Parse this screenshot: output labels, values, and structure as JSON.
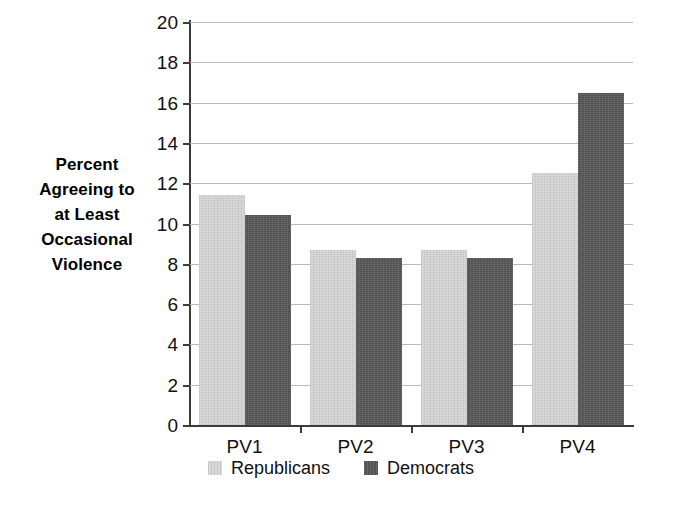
{
  "chart_data": {
    "type": "bar",
    "title": "",
    "subtitle": "",
    "xlabel": "",
    "ylabel": "Percent Agreeing to at Least Occasional Violence",
    "ylabel_lines": [
      "Percent",
      "Agreeing to",
      "at Least",
      "Occasional",
      "Violence"
    ],
    "categories": [
      "PV1",
      "PV2",
      "PV3",
      "PV4"
    ],
    "series": [
      {
        "name": "Republicans",
        "color": "#d6d6d6",
        "values": [
          11.4,
          8.7,
          8.7,
          12.5
        ]
      },
      {
        "name": "Democrats",
        "color": "#5a5a5a",
        "values": [
          10.4,
          8.3,
          8.3,
          16.5
        ]
      }
    ],
    "ylim": [
      0,
      20
    ],
    "ytick_step": 2,
    "yticks": [
      "20",
      "18",
      "16",
      "14",
      "12",
      "10",
      "8",
      "6",
      "4",
      "2",
      "0"
    ],
    "ytick_values": [
      20,
      18,
      16,
      14,
      12,
      10,
      8,
      6,
      4,
      2,
      0
    ],
    "grid": true,
    "grid_axis": "y",
    "legend": true,
    "legend_position": "bottom",
    "legend_entries": [
      "Republicans",
      "Democrats"
    ],
    "background_color": "#ffffff",
    "axis_color": "#3b3b3b",
    "grid_color": "#b9b9b9"
  }
}
